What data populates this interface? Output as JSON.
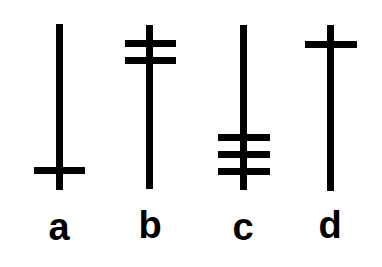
{
  "symbols": [
    {
      "label": "a",
      "crossbars": 1,
      "crossbar_position": "bottom"
    },
    {
      "label": "b",
      "crossbars": 2,
      "crossbar_position": "top"
    },
    {
      "label": "c",
      "crossbars": 3,
      "crossbar_position": "bottom"
    },
    {
      "label": "d",
      "crossbars": 1,
      "crossbar_position": "top"
    }
  ],
  "colors": {
    "stroke": "#000000",
    "background": "#ffffff"
  }
}
